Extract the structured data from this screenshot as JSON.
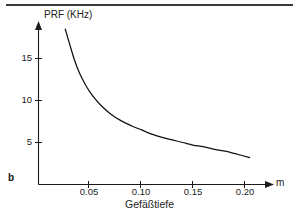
{
  "figure": {
    "panel_label": "b",
    "top_rule_color": "#3a3a3a",
    "curve_color": "#111111",
    "axis_color": "#1a1a1a",
    "background": "#ffffff"
  },
  "chart_data": {
    "type": "line",
    "title": "",
    "subtitle": "",
    "xlabel": "Gefäßtiefe",
    "ylabel": "PRF (KHz)",
    "x_unit": "m",
    "xlim": [
      0.0,
      0.215
    ],
    "ylim": [
      0.0,
      19.0
    ],
    "x_ticks": [
      0.05,
      0.1,
      0.15,
      0.2
    ],
    "x_tick_labels": [
      "0.05",
      "0.10",
      "0.15",
      "0.20"
    ],
    "y_ticks": [
      5,
      10,
      15
    ],
    "y_tick_labels": [
      "5",
      "10",
      "15"
    ],
    "grid": false,
    "legend": null,
    "annotations": [],
    "series": [
      {
        "name": "PRF vs Gefäßtiefe",
        "x": [
          0.026,
          0.03,
          0.035,
          0.04,
          0.045,
          0.05,
          0.055,
          0.06,
          0.07,
          0.08,
          0.09,
          0.1,
          0.11,
          0.12,
          0.13,
          0.14,
          0.15,
          0.16,
          0.17,
          0.18,
          0.19,
          0.205
        ],
        "y": [
          18.5,
          16.8,
          14.8,
          13.2,
          12.0,
          11.0,
          10.2,
          9.5,
          8.4,
          7.6,
          7.0,
          6.5,
          6.0,
          5.6,
          5.3,
          5.0,
          4.7,
          4.5,
          4.2,
          4.0,
          3.7,
          3.2
        ]
      }
    ]
  },
  "axis_labels": {
    "y_title": "PRF (KHz)",
    "x_title": "Gefäßtiefe",
    "x_unit": "m"
  }
}
